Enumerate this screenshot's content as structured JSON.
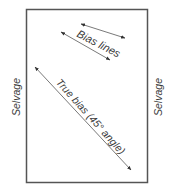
{
  "diagram": {
    "type": "fabric-grain-diagram",
    "labels": {
      "bias_lines": "Bias lines",
      "true_bias": "True bias (45° angle)",
      "selvage_left": "Selvage",
      "selvage_right": "Selvage"
    },
    "colors": {
      "line": "#6a6a6a",
      "border": "#555555",
      "text": "#3a3a3a",
      "background": "#ffffff"
    }
  }
}
